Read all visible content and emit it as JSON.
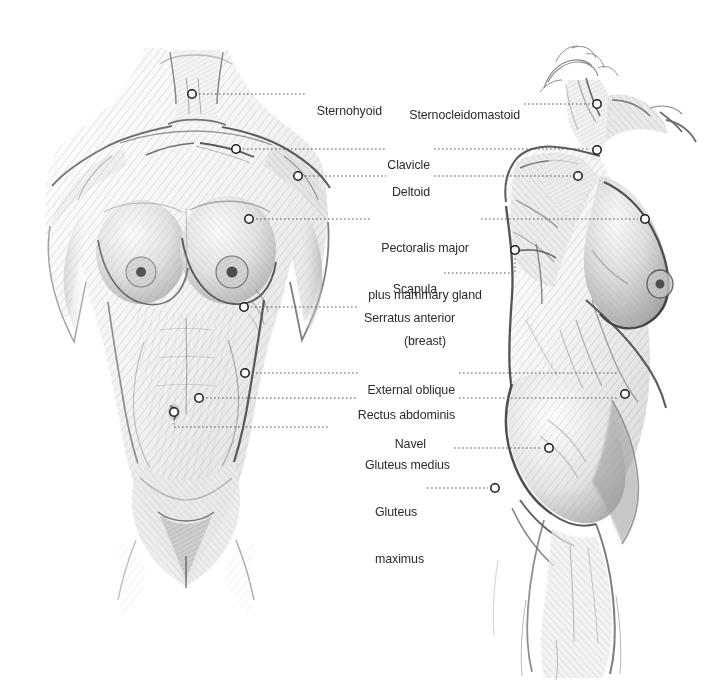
{
  "diagram": {
    "background_color": "#ffffff",
    "text_color": "#2b2b2b",
    "leader_color": "#555555",
    "marker_fill": "#ffffff",
    "marker_stroke": "#1a1a1a",
    "views": [
      {
        "name": "anterior-view",
        "description": "Front view of female torso, pencil sketch"
      },
      {
        "name": "lateral-view",
        "description": "Three-quarter side view of female torso, pencil sketch"
      }
    ],
    "labels": [
      {
        "id": "sternohyoid",
        "text": "Sternohyoid",
        "align": "left",
        "x": 310,
        "y": 88,
        "lines": [
          "Sternohyoid"
        ]
      },
      {
        "id": "clavicle",
        "text": "Clavicle",
        "align": "right",
        "x": 430,
        "y": 142,
        "lines": [
          "Clavicle"
        ]
      },
      {
        "id": "deltoid",
        "text": "Deltoid",
        "align": "right",
        "x": 430,
        "y": 170,
        "lines": [
          "Deltoid"
        ]
      },
      {
        "id": "pectoralis-major",
        "text": "Pectoralis major plus mammary gland (breast)",
        "align": "center",
        "x": 425,
        "y": 210,
        "lines": [
          "Pectoralis major",
          "plus mammary gland",
          "(breast)"
        ]
      },
      {
        "id": "scapula",
        "text": "Scapula",
        "align": "right",
        "x": 437,
        "y": 272,
        "lines": [
          "Scapula"
        ]
      },
      {
        "id": "serratus-anterior",
        "text": "Serratus anterior",
        "align": "right",
        "x": 455,
        "y": 301,
        "lines": [
          "Serratus anterior"
        ]
      },
      {
        "id": "external-oblique",
        "text": "External oblique",
        "align": "right",
        "x": 455,
        "y": 367,
        "lines": [
          "External oblique"
        ]
      },
      {
        "id": "rectus-abdominis",
        "text": "Rectus abdominis",
        "align": "right",
        "x": 455,
        "y": 393,
        "lines": [
          "Rectus abdominis"
        ]
      },
      {
        "id": "navel",
        "text": "Navel",
        "align": "right",
        "x": 426,
        "y": 421,
        "lines": [
          "Navel"
        ]
      },
      {
        "id": "gluteus-medius",
        "text": "Gluteus medius",
        "align": "right",
        "x": 450,
        "y": 442,
        "lines": [
          "Gluteus medius"
        ]
      },
      {
        "id": "gluteus-maximus",
        "text": "Gluteus maximus",
        "align": "left",
        "x": 375,
        "y": 473,
        "lines": [
          "Gluteus",
          "maximus"
        ]
      },
      {
        "id": "sternocleidomastoid",
        "text": "Sternocleidomastoid",
        "align": "right",
        "x": 520,
        "y": 92,
        "lines": [
          "Sternocleidomastoid"
        ]
      }
    ],
    "markers": [
      {
        "id": "marker-sternohyoid-front",
        "label": "Sternohyoid",
        "x": 192,
        "y": 94
      },
      {
        "id": "marker-clavicle-front",
        "label": "Clavicle",
        "x": 236,
        "y": 149
      },
      {
        "id": "marker-deltoid-front",
        "label": "Deltoid",
        "x": 298,
        "y": 175
      },
      {
        "id": "marker-pectoralis-front",
        "label": "Pectoralis major",
        "x": 249,
        "y": 219
      },
      {
        "id": "marker-serratus-front",
        "label": "Serratus anterior",
        "x": 244,
        "y": 307
      },
      {
        "id": "marker-external-oblique-front",
        "label": "External oblique",
        "x": 245,
        "y": 373
      },
      {
        "id": "marker-rectus-abdominis-front",
        "label": "Rectus abdominis",
        "x": 199,
        "y": 398
      },
      {
        "id": "marker-navel-front",
        "label": "Navel",
        "x": 174,
        "y": 412
      },
      {
        "id": "marker-sternocleidomastoid-side",
        "label": "Sternocleidomastoid",
        "x": 597,
        "y": 104
      },
      {
        "id": "marker-clavicle-side",
        "label": "Clavicle",
        "x": 597,
        "y": 150
      },
      {
        "id": "marker-deltoid-side",
        "label": "Deltoid",
        "x": 578,
        "y": 176
      },
      {
        "id": "marker-pectoralis-side",
        "label": "Pectoralis major",
        "x": 645,
        "y": 219
      },
      {
        "id": "marker-scapula-side",
        "label": "Scapula",
        "x": 515,
        "y": 250
      },
      {
        "id": "marker-external-oblique-side",
        "label": "External oblique",
        "x": 625,
        "y": 394
      },
      {
        "id": "marker-gluteus-medius-side",
        "label": "Gluteus medius",
        "x": 549,
        "y": 448
      },
      {
        "id": "marker-gluteus-maximus-side",
        "label": "Gluteus maximus",
        "x": 495,
        "y": 488
      }
    ]
  }
}
